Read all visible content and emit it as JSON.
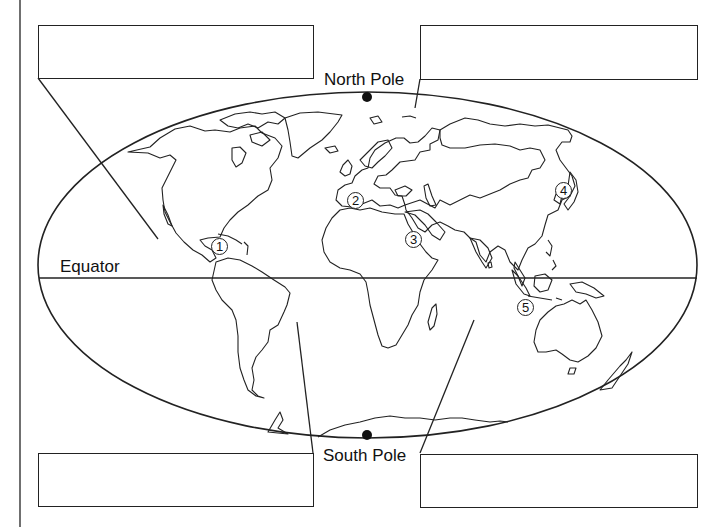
{
  "diagram": {
    "type": "world-map-worksheet",
    "labels": {
      "north_pole": "North Pole",
      "south_pole": "South Pole",
      "equator": "Equator"
    },
    "answer_boxes": [
      {
        "id": "top-left",
        "value": ""
      },
      {
        "id": "top-right",
        "value": ""
      },
      {
        "id": "bottom-left",
        "value": ""
      },
      {
        "id": "bottom-right",
        "value": ""
      }
    ],
    "markers": [
      {
        "number": "1",
        "location_hint": "Caribbean / Central America"
      },
      {
        "number": "2",
        "location_hint": "Strait of Gibraltar"
      },
      {
        "number": "3",
        "location_hint": "Red Sea"
      },
      {
        "number": "4",
        "location_hint": "Japan"
      },
      {
        "number": "5",
        "location_hint": "Indonesia / Timor"
      }
    ],
    "leader_lines": [
      {
        "from": "top-left",
        "points_to": "Pacific Ocean (north)"
      },
      {
        "from": "top-right",
        "points_to": "Arctic Ocean"
      },
      {
        "from": "bottom-left",
        "points_to": "Atlantic Ocean (south)"
      },
      {
        "from": "bottom-right",
        "points_to": "Indian Ocean"
      }
    ],
    "colors": {
      "line": "#222222",
      "background": "#ffffff"
    }
  }
}
